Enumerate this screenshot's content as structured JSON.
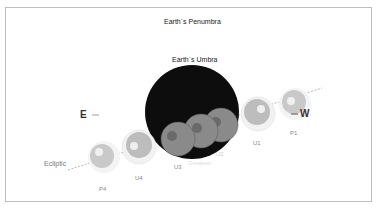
{
  "diagram": {
    "title": "Earth`s Penumbra",
    "umbra_label": "Earth`s Umbra",
    "east_label": "E",
    "west_label": "W",
    "ecliptic_label": "Ecliptic",
    "positions": [
      {
        "id": "P1",
        "label": "P1"
      },
      {
        "id": "U1",
        "label": "U1"
      },
      {
        "id": "U2",
        "label": "U2"
      },
      {
        "id": "Greatest",
        "label": "Greatest"
      },
      {
        "id": "U3",
        "label": "U3"
      },
      {
        "id": "U4",
        "label": "U4"
      },
      {
        "id": "P4",
        "label": "P4"
      }
    ],
    "colors": {
      "umbra": "#0d0d0d",
      "moon_in_umbra": "#8a8a8a",
      "moon_penumbra": "#c8c8c8",
      "border": "#bdbdbd"
    }
  }
}
